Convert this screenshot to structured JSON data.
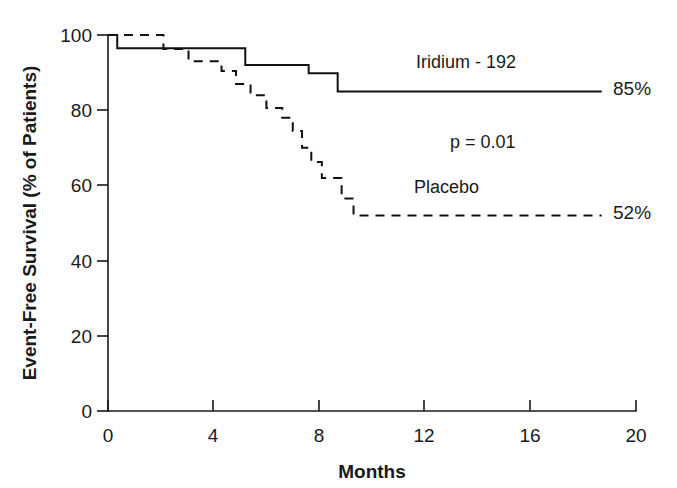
{
  "chart_data": {
    "type": "line",
    "subtype": "kaplan-meier-step",
    "title": "",
    "xlabel": "Months",
    "ylabel": "Event-Free Survival (% of Patients)",
    "xlim": [
      0,
      20
    ],
    "ylim": [
      0,
      100
    ],
    "xticks": [
      0,
      4,
      8,
      12,
      16,
      20
    ],
    "yticks": [
      0,
      20,
      40,
      60,
      80,
      100
    ],
    "xticklabels": [
      "0",
      "4",
      "8",
      "12",
      "16",
      "20"
    ],
    "yticklabels": [
      "0",
      "20",
      "40",
      "60",
      "80",
      "100"
    ],
    "grid": false,
    "legend_position": "inline-annotations",
    "annotations": [
      {
        "name": "p-value",
        "text": "p = 0.01",
        "x": 13.2,
        "y": 68
      },
      {
        "name": "iridium-series-label",
        "text": "Iridium - 192",
        "x": 11.7,
        "y": 90
      },
      {
        "name": "placebo-series-label",
        "text": "Placebo",
        "x": 11.6,
        "y": 58
      },
      {
        "name": "iridium-endpoint-label",
        "text": "85%",
        "x": 19.2,
        "y": 85
      },
      {
        "name": "placebo-endpoint-label",
        "text": "52%",
        "x": 19.2,
        "y": 52
      }
    ],
    "series": [
      {
        "name": "Iridium - 192",
        "style": "solid",
        "final_value": 85,
        "final_label": "52%",
        "steps": [
          {
            "x": 0.0,
            "y": 100
          },
          {
            "x": 0.35,
            "y": 100
          },
          {
            "x": 0.35,
            "y": 96.5
          },
          {
            "x": 5.2,
            "y": 96.5
          },
          {
            "x": 5.2,
            "y": 92.0
          },
          {
            "x": 7.6,
            "y": 92.0
          },
          {
            "x": 7.6,
            "y": 89.8
          },
          {
            "x": 8.7,
            "y": 89.8
          },
          {
            "x": 8.7,
            "y": 85.0
          },
          {
            "x": 18.7,
            "y": 85.0
          }
        ]
      },
      {
        "name": "Placebo",
        "style": "dashed",
        "final_value": 52,
        "final_label": "52%",
        "steps": [
          {
            "x": 0.0,
            "y": 100
          },
          {
            "x": 2.1,
            "y": 100
          },
          {
            "x": 2.1,
            "y": 96.3
          },
          {
            "x": 3.05,
            "y": 96.3
          },
          {
            "x": 3.05,
            "y": 93.0
          },
          {
            "x": 4.3,
            "y": 93.0
          },
          {
            "x": 4.3,
            "y": 90.4
          },
          {
            "x": 4.85,
            "y": 90.4
          },
          {
            "x": 4.85,
            "y": 87.0
          },
          {
            "x": 5.4,
            "y": 87.0
          },
          {
            "x": 5.4,
            "y": 84.0
          },
          {
            "x": 6.0,
            "y": 84.0
          },
          {
            "x": 6.0,
            "y": 80.6
          },
          {
            "x": 6.6,
            "y": 80.6
          },
          {
            "x": 6.6,
            "y": 78.0
          },
          {
            "x": 7.0,
            "y": 78.0
          },
          {
            "x": 7.0,
            "y": 74.5
          },
          {
            "x": 7.35,
            "y": 74.5
          },
          {
            "x": 7.35,
            "y": 70.0
          },
          {
            "x": 7.7,
            "y": 70.0
          },
          {
            "x": 7.7,
            "y": 66.2
          },
          {
            "x": 8.1,
            "y": 66.2
          },
          {
            "x": 8.1,
            "y": 62.0
          },
          {
            "x": 8.85,
            "y": 62.0
          },
          {
            "x": 8.85,
            "y": 56.5
          },
          {
            "x": 9.3,
            "y": 56.5
          },
          {
            "x": 9.3,
            "y": 52.0
          },
          {
            "x": 18.7,
            "y": 52.0
          }
        ]
      }
    ]
  },
  "axes": {
    "x_title": "Months",
    "y_title": "Event-Free Survival (% of Patients)"
  }
}
